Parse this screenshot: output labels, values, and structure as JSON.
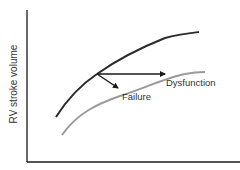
{
  "diagram": {
    "ylabel": "RV stroke volume",
    "xlabel": "",
    "labels": {
      "dysfunction": "Dysfunction",
      "failure": "Failure"
    },
    "colors": {
      "axis": "#1a1a1a",
      "normal_curve": "#2b2b2b",
      "depressed_curve": "#9a9a9a",
      "arrow": "#1a1a1a",
      "text": "#333333"
    },
    "curves": [
      {
        "name": "normal",
        "description": "upper dark curve"
      },
      {
        "name": "depressed",
        "description": "lower gray curve"
      }
    ],
    "arrows": [
      {
        "name": "dysfunction",
        "direction": "horizontal to lower curve"
      },
      {
        "name": "failure",
        "direction": "down-right to lower curve"
      }
    ]
  }
}
